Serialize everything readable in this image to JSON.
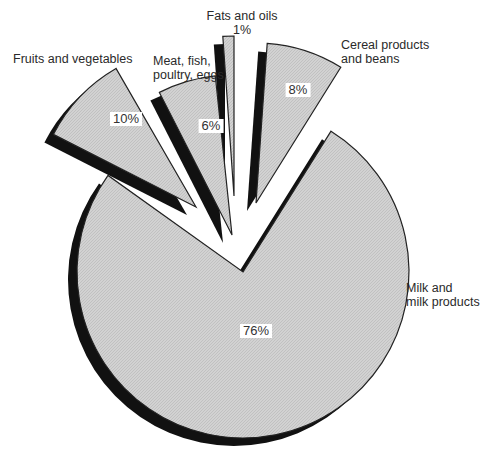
{
  "chart_data": {
    "type": "pie",
    "title": "",
    "style": "exploded 3D pie with dark drop shadows and light gray hatched fill",
    "slices": [
      {
        "label": "Milk and milk products",
        "value": 76,
        "value_label": "76%",
        "exploded": false
      },
      {
        "label": "Cereal products and beans",
        "value": 8,
        "value_label": "8%",
        "exploded": true
      },
      {
        "label": "Fats and oils",
        "value": 1,
        "value_label": "1%",
        "exploded": true
      },
      {
        "label": "Meat, fish, poultry, eggs",
        "value": 6,
        "value_label": "6%",
        "exploded": true
      },
      {
        "label": "Fruits and vegetables",
        "value": 10,
        "value_label": "10%",
        "exploded": true
      }
    ]
  },
  "labels": {
    "milk_line1": "Milk and",
    "milk_line2": "milk products",
    "cereal_line1": "Cereal products",
    "cereal_line2": "and beans",
    "fats_line1": "Fats and oils",
    "fats_pct": "1%",
    "meat_line1": "Meat, fish,",
    "meat_line2": "poultry, eggs",
    "fruits_line1": "Fruits and vegetables",
    "milk_pct": "76%",
    "cereal_pct": "8%",
    "meat_pct": "6%",
    "fruits_pct": "10%"
  },
  "colors": {
    "fill": "#cfcfcf",
    "shadow": "#111111",
    "outline": "#222222",
    "background": "#ffffff"
  }
}
